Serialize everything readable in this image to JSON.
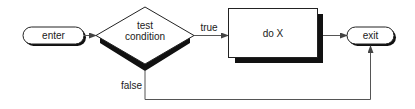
{
  "diagram": {
    "type": "flowchart",
    "nodes": {
      "enter": {
        "label": "enter",
        "shape": "terminator"
      },
      "test": {
        "label_line1": "test",
        "label_line2": "condition",
        "shape": "decision"
      },
      "action": {
        "label": "do X",
        "shape": "process"
      },
      "exit": {
        "label": "exit",
        "shape": "terminator"
      }
    },
    "edges": {
      "enter_to_test": {
        "from": "enter",
        "to": "test",
        "label": ""
      },
      "test_true": {
        "from": "test",
        "to": "action",
        "label": "true"
      },
      "action_to_exit": {
        "from": "action",
        "to": "exit",
        "label": ""
      },
      "test_false": {
        "from": "test",
        "to": "exit",
        "label": "false"
      }
    },
    "colors": {
      "outline": "#222222",
      "shadow": "#111111",
      "connector": "#555555",
      "fill": "#ffffff"
    }
  }
}
